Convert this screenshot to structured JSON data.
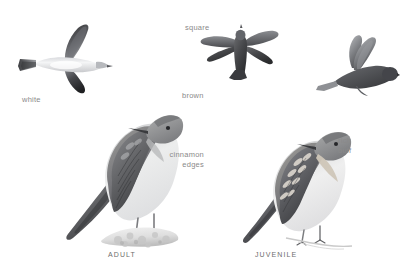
{
  "plate": {
    "width": 407,
    "height": 280,
    "background": "#ffffff",
    "medium": "grayscale-illustration",
    "label_color": "#8a8a8a",
    "caption_color": "#6e6e6e"
  },
  "labels": [
    {
      "id": "white",
      "text": "white",
      "x": 22,
      "y": 95,
      "align": "left"
    },
    {
      "id": "square",
      "text": "square",
      "x": 185,
      "y": 23,
      "align": "left"
    },
    {
      "id": "brown",
      "text": "brown",
      "x": 182,
      "y": 91,
      "align": "left"
    },
    {
      "id": "cinnamon",
      "text": "cinnamon",
      "x": 204,
      "y": 150,
      "align": "right"
    },
    {
      "id": "edges",
      "text": "edges",
      "x": 204,
      "y": 160,
      "align": "right"
    },
    {
      "id": "rich",
      "text": "rich",
      "x": 338,
      "y": 136,
      "align": "left"
    },
    {
      "id": "buff",
      "text": "buff",
      "x": 338,
      "y": 146,
      "align": "left"
    }
  ],
  "captions": [
    {
      "id": "adult",
      "text": "ADULT",
      "x": 108,
      "y": 251
    },
    {
      "id": "juvenile",
      "text": "JUVENILE",
      "x": 255,
      "y": 251
    }
  ],
  "figures": [
    {
      "id": "flight-underside",
      "name": "flying-bird-underside",
      "description": "Swallow in flight, underside view, pale white underparts, dark upperwing, square tail at left",
      "x": 18,
      "y": 22,
      "width": 95,
      "height": 72
    },
    {
      "id": "flight-dorsal",
      "name": "flying-bird-dorsal",
      "description": "Swallow in flight seen from above, uniformly brown, square tail",
      "x": 196,
      "y": 24,
      "width": 86,
      "height": 58
    },
    {
      "id": "flight-banking",
      "name": "flying-bird-banking",
      "description": "Swallow banking with wings raised, brown upperparts",
      "x": 308,
      "y": 34,
      "width": 92,
      "height": 62
    },
    {
      "id": "perched-adult",
      "name": "perched-adult-bird",
      "description": "Adult swallow perched on pale rock, facing right, brown back, dusky throat, whitish belly",
      "x": 62,
      "y": 84,
      "width": 122,
      "height": 162
    },
    {
      "id": "perched-juvenile",
      "name": "perched-juvenile-bird",
      "description": "Juvenile swallow perched on thin twig, facing right, cinnamon wing edges, rich buff throat",
      "x": 240,
      "y": 112,
      "width": 118,
      "height": 134
    }
  ]
}
